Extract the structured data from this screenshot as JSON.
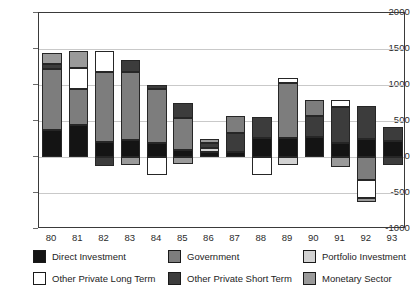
{
  "chart_data": {
    "type": "bar",
    "subtype": "stacked-bar-positive-negative",
    "title": "",
    "xlabel": "",
    "ylabel": "",
    "ylim": [
      -1000,
      2000
    ],
    "ytick_values": [
      2000,
      1500,
      1000,
      500,
      0,
      -500,
      -1000
    ],
    "ytick_labels": [
      "2000",
      "1500",
      "1000",
      "500",
      "0",
      "-500",
      "-1000"
    ],
    "grid": true,
    "grid_axis": "y",
    "legend_position": "bottom",
    "categories": [
      "80",
      "81",
      "82",
      "83",
      "84",
      "85",
      "86",
      "87",
      "88",
      "89",
      "90",
      "91",
      "92",
      "93"
    ],
    "series": [
      {
        "name": "Direct Investment",
        "color": "#141414",
        "values": [
          370,
          440,
          205,
          240,
          200,
          95,
          70,
          70,
          265,
          270,
          275,
          195,
          250,
          225
        ]
      },
      {
        "name": "Government",
        "color": "#7d7d7d",
        "values": [
          855,
          500,
          975,
          935,
          740,
          450,
          0,
          235,
          0,
          755,
          225,
          0,
          0,
          0
        ]
      },
      {
        "name": "Portfolio Investment",
        "color": "#d2d2d2",
        "values": [
          0,
          0,
          0,
          0,
          0,
          0,
          50,
          0,
          0,
          0,
          0,
          0,
          0,
          0
        ]
      },
      {
        "name": "Other Private Long Term",
        "color": "#ffffff",
        "values": [
          0,
          295,
          295,
          0,
          0,
          0,
          0,
          0,
          0,
          75,
          0,
          100,
          0,
          0
        ]
      },
      {
        "name": "Other Private Short Term",
        "color": "#3c3c3c",
        "values": [
          60,
          0,
          0,
          175,
          60,
          200,
          70,
          260,
          290,
          0,
          290,
          500,
          465,
          195
        ]
      },
      {
        "name": "Monetary Sector",
        "color": "#9a9a9a",
        "values": [
          165,
          235,
          0,
          0,
          0,
          0,
          0,
          0,
          0,
          0,
          0,
          0,
          0,
          0
        ]
      }
    ],
    "negative_segments": {
      "82": [
        {
          "name": "Other Private Short Term",
          "value": -125
        }
      ],
      "83": [
        {
          "name": "Monetary Sector",
          "value": -115
        }
      ],
      "84": [
        {
          "name": "Other Private Long Term",
          "value": -250
        }
      ],
      "85": [
        {
          "name": "Monetary Sector",
          "value": -95
        }
      ],
      "88": [
        {
          "name": "Other Private Long Term",
          "value": -250
        }
      ],
      "89": [
        {
          "name": "Portfolio Investment",
          "value": -105
        }
      ],
      "91": [
        {
          "name": "Monetary Sector",
          "value": -135
        }
      ],
      "92": [
        {
          "name": "Government",
          "value": -315
        },
        {
          "name": "Other Private Long Term",
          "value": -250
        },
        {
          "name": "Monetary Sector",
          "value": -65
        }
      ],
      "93": [
        {
          "name": "Other Private Short Term",
          "value": -110
        }
      ]
    },
    "stack_order_note": "Positive stack drawn upward from zero; negative stack drawn downward from zero."
  },
  "axis": {
    "y_ticks": [
      {
        "label": "2000",
        "value": 2000
      },
      {
        "label": "1500",
        "value": 1500
      },
      {
        "label": "1000",
        "value": 1000
      },
      {
        "label": "500",
        "value": 500
      },
      {
        "label": "0",
        "value": 0
      },
      {
        "label": "-500",
        "value": -500
      },
      {
        "label": "-1000",
        "value": -1000
      }
    ],
    "x_ticks": [
      "80",
      "81",
      "82",
      "83",
      "84",
      "85",
      "86",
      "87",
      "88",
      "89",
      "90",
      "91",
      "92",
      "93"
    ]
  },
  "legend": {
    "items": [
      {
        "label": "Direct Investment",
        "color": "#141414",
        "col": 0,
        "row": 0
      },
      {
        "label": "Government",
        "color": "#7d7d7d",
        "col": 1,
        "row": 0
      },
      {
        "label": "Portfolio Investment",
        "color": "#d2d2d2",
        "col": 2,
        "row": 0
      },
      {
        "label": "Other Private Long Term",
        "color": "#ffffff",
        "col": 0,
        "row": 1
      },
      {
        "label": "Other Private Short Term",
        "color": "#3c3c3c",
        "col": 1,
        "row": 1
      },
      {
        "label": "Monetary Sector",
        "color": "#9a9a9a",
        "col": 2,
        "row": 1
      }
    ]
  },
  "style": {
    "plot_border_color": "#3a3a3a",
    "gridline_color": "#c9c9c9",
    "bar_edge_color": "#262626",
    "background": "#ffffff",
    "text_color": "#2b2b2b"
  },
  "bars_render": [
    {
      "cat": "80",
      "pos": [
        {
          "s": "Direct Investment",
          "v": 370
        },
        {
          "s": "Government",
          "v": 855
        },
        {
          "s": "Other Private Short Term",
          "v": 60
        },
        {
          "s": "Monetary Sector",
          "v": 165
        }
      ],
      "neg": []
    },
    {
      "cat": "81",
      "pos": [
        {
          "s": "Direct Investment",
          "v": 440
        },
        {
          "s": "Government",
          "v": 500
        },
        {
          "s": "Other Private Long Term",
          "v": 295
        },
        {
          "s": "Monetary Sector",
          "v": 235
        }
      ],
      "neg": []
    },
    {
      "cat": "82",
      "pos": [
        {
          "s": "Direct Investment",
          "v": 205
        },
        {
          "s": "Government",
          "v": 975
        },
        {
          "s": "Other Private Long Term",
          "v": 295
        }
      ],
      "neg": [
        {
          "s": "Other Private Short Term",
          "v": -125
        }
      ]
    },
    {
      "cat": "83",
      "pos": [
        {
          "s": "Direct Investment",
          "v": 240
        },
        {
          "s": "Government",
          "v": 935
        },
        {
          "s": "Other Private Short Term",
          "v": 175
        }
      ],
      "neg": [
        {
          "s": "Monetary Sector",
          "v": -115
        }
      ]
    },
    {
      "cat": "84",
      "pos": [
        {
          "s": "Direct Investment",
          "v": 200
        },
        {
          "s": "Government",
          "v": 740
        },
        {
          "s": "Other Private Short Term",
          "v": 60
        }
      ],
      "neg": [
        {
          "s": "Other Private Long Term",
          "v": -250
        }
      ]
    },
    {
      "cat": "85",
      "pos": [
        {
          "s": "Direct Investment",
          "v": 95
        },
        {
          "s": "Government",
          "v": 450
        },
        {
          "s": "Other Private Short Term",
          "v": 200
        }
      ],
      "neg": [
        {
          "s": "Monetary Sector",
          "v": -95
        }
      ]
    },
    {
      "cat": "86",
      "pos": [
        {
          "s": "Direct Investment",
          "v": 70
        },
        {
          "s": "Portfolio Investment",
          "v": 50
        },
        {
          "s": "Other Private Short Term",
          "v": 70
        },
        {
          "s": "Monetary Sector",
          "v": 55
        }
      ],
      "neg": []
    },
    {
      "cat": "87",
      "pos": [
        {
          "s": "Direct Investment",
          "v": 70
        },
        {
          "s": "Other Private Short Term",
          "v": 260
        },
        {
          "s": "Government",
          "v": 235
        }
      ],
      "neg": []
    },
    {
      "cat": "88",
      "pos": [
        {
          "s": "Direct Investment",
          "v": 265
        },
        {
          "s": "Other Private Short Term",
          "v": 290
        }
      ],
      "neg": [
        {
          "s": "Other Private Long Term",
          "v": -250
        }
      ]
    },
    {
      "cat": "89",
      "pos": [
        {
          "s": "Direct Investment",
          "v": 270
        },
        {
          "s": "Government",
          "v": 755
        },
        {
          "s": "Other Private Long Term",
          "v": 75
        }
      ],
      "neg": [
        {
          "s": "Portfolio Investment",
          "v": -105
        }
      ]
    },
    {
      "cat": "90",
      "pos": [
        {
          "s": "Direct Investment",
          "v": 275
        },
        {
          "s": "Other Private Short Term",
          "v": 290
        },
        {
          "s": "Government",
          "v": 225
        }
      ],
      "neg": []
    },
    {
      "cat": "91",
      "pos": [
        {
          "s": "Direct Investment",
          "v": 195
        },
        {
          "s": "Other Private Short Term",
          "v": 500
        },
        {
          "s": "Other Private Long Term",
          "v": 100
        }
      ],
      "neg": [
        {
          "s": "Monetary Sector",
          "v": -135
        }
      ]
    },
    {
      "cat": "92",
      "pos": [
        {
          "s": "Direct Investment",
          "v": 250
        },
        {
          "s": "Other Private Short Term",
          "v": 465
        }
      ],
      "neg": [
        {
          "s": "Government",
          "v": -315
        },
        {
          "s": "Other Private Long Term",
          "v": -250
        },
        {
          "s": "Monetary Sector",
          "v": -65
        }
      ]
    },
    {
      "cat": "93",
      "pos": [
        {
          "s": "Direct Investment",
          "v": 225
        },
        {
          "s": "Other Private Short Term",
          "v": 195
        }
      ],
      "neg": [
        {
          "s": "Other Private Short Term",
          "v": -110
        }
      ]
    }
  ]
}
